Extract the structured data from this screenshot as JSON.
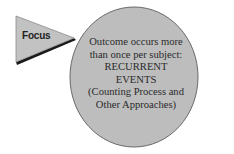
{
  "pointer": {
    "label": "Focus",
    "fill": "#c2c2c2",
    "shadow": "#1a1a1a"
  },
  "bubble": {
    "fill": "#bdbdbd",
    "stroke": "#6a6a6a",
    "lines": [
      "Outcome occurs more",
      "than once per subject:",
      "RECURRENT",
      "EVENTS",
      "(Counting Process and",
      "Other Approaches)"
    ]
  }
}
